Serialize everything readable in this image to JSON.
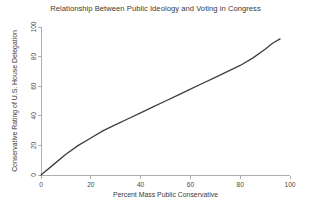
{
  "chart_data": {
    "type": "line",
    "title": "Relationship Between Public Ideology and Voting in Congress",
    "xlabel": "Percent Mass Public Conservative",
    "ylabel": "Conservative Rating of U.S. House Delegation",
    "xlim": [
      0,
      100
    ],
    "ylim": [
      0,
      100
    ],
    "xticks": [
      0,
      20,
      40,
      60,
      80,
      100
    ],
    "yticks": [
      0,
      20,
      40,
      60,
      80,
      100
    ],
    "xticklabels": [
      "0",
      "20",
      "40",
      "60",
      "80",
      "100"
    ],
    "yticklabels": [
      "0",
      "20",
      "40",
      "60",
      "80",
      "100"
    ],
    "grid": false,
    "legend": false,
    "legend_position": "none",
    "line_color": "#404040",
    "axis_color": "#9a9a9a",
    "background_color": "#ffffff",
    "series": [
      {
        "name": "Conservative Rating of U.S. House Delegation",
        "x": [
          0,
          5,
          10,
          15,
          20,
          25,
          30,
          35,
          40,
          45,
          50,
          55,
          60,
          65,
          70,
          75,
          80,
          85,
          90,
          93,
          96
        ],
        "y": [
          0,
          7,
          14,
          20,
          25,
          30,
          34,
          38,
          42,
          46,
          50,
          54,
          58,
          62,
          66,
          70,
          74,
          79,
          85,
          89,
          92
        ]
      }
    ]
  }
}
